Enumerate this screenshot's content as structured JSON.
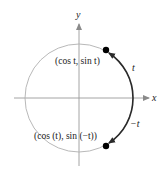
{
  "diagram": {
    "axes": {
      "x_label": "x",
      "y_label": "y",
      "axis_color": "#9a9a9a"
    },
    "circle": {
      "color": "#b0b0b0"
    },
    "arcs": {
      "color": "#2a2a2a",
      "upper_label": "t",
      "lower_label": "−t"
    },
    "points": {
      "upper_label": "(cos t, sin t)",
      "lower_label": "(cos (t), sin (−t))",
      "color": "#000000"
    }
  }
}
